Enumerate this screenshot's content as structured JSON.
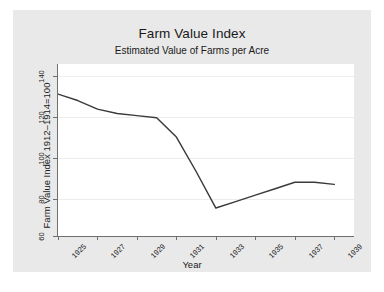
{
  "chart_data": {
    "type": "line",
    "title": "Farm Value Index",
    "subtitle": "Estimated Value of Farms per Acre",
    "xlabel": "Year",
    "ylabel": "Farm Value Index 1912–1914=100",
    "xlim": [
      1925,
      1940
    ],
    "ylim": [
      60,
      140
    ],
    "yticks": [
      60,
      80,
      100,
      120,
      140
    ],
    "ytick_labels": [
      "60",
      "80",
      "100",
      "120",
      "140"
    ],
    "xticks": [
      1925,
      1927,
      1929,
      1931,
      1933,
      1935,
      1937,
      1939
    ],
    "xtick_labels": [
      "1925",
      "1927",
      "1929",
      "1931",
      "1933",
      "1935",
      "1937",
      "1939"
    ],
    "grid": "horizontal",
    "legend": "none",
    "line_color": "#3a3a3a",
    "plot_background": "#ffffff",
    "figure_background": "#e9e9e9",
    "x": [
      1925,
      1926,
      1927,
      1928,
      1929,
      1930,
      1931,
      1932,
      1933,
      1934,
      1935,
      1936,
      1937,
      1938,
      1939
    ],
    "values": [
      126,
      123,
      119,
      117,
      116,
      115,
      106,
      90,
      73,
      76,
      79,
      82,
      85,
      85,
      84
    ],
    "series": [
      {
        "name": "Farm Value Index",
        "values": [
          126,
          123,
          119,
          117,
          116,
          115,
          106,
          90,
          73,
          76,
          79,
          82,
          85,
          85,
          84
        ]
      }
    ]
  },
  "caption": ""
}
